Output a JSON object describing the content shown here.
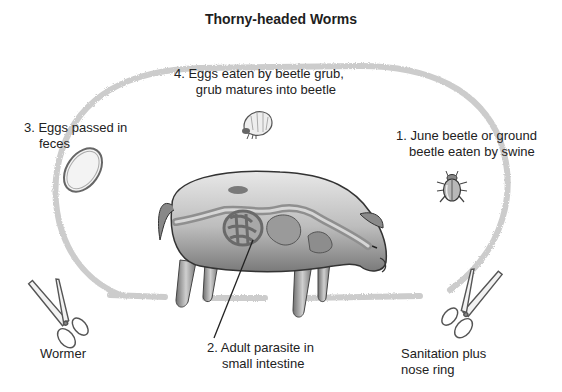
{
  "diagram": {
    "title": "Thorny-headed Worms",
    "type": "life-cycle",
    "stages": [
      {
        "number": "4.",
        "line1": "4. Eggs eaten by beetle grub,",
        "line2": "grub matures into beetle",
        "icon": "beetle-grub"
      },
      {
        "number": "3.",
        "line1": "3. Eggs passed in",
        "line2": "feces",
        "icon": "egg"
      },
      {
        "number": "1.",
        "line1": "1. June beetle or ground",
        "line2": "beetle eaten by swine",
        "icon": "beetle"
      },
      {
        "number": "2.",
        "line1": "2. Adult parasite in",
        "line2": "small intestine",
        "icon": "pig-intestine"
      }
    ],
    "controls": [
      {
        "line1": "Wormer",
        "line2": "",
        "icon": "scissors"
      },
      {
        "line1": "Sanitation plus",
        "line2": "nose ring",
        "icon": "scissors"
      }
    ],
    "colors": {
      "loop": "#c8c8c8",
      "ink": "#222222",
      "pig_shade": "#9a9a9a"
    }
  }
}
